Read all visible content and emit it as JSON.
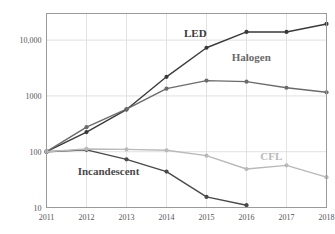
{
  "chart_data": {
    "type": "line",
    "title": "",
    "subtitle": "",
    "xlabel": "",
    "ylabel": "",
    "x": [
      2011,
      2012,
      2013,
      2014,
      2015,
      2016,
      2017,
      2018
    ],
    "categories": [
      "2011",
      "2012",
      "2013",
      "2014",
      "2015",
      "2016",
      "2017",
      "2018"
    ],
    "y_scale": "log",
    "ylim": [
      10,
      30000
    ],
    "y_ticks": [
      10,
      100,
      1000,
      10000
    ],
    "y_tick_labels": [
      "10",
      "100",
      "1000",
      "10,000"
    ],
    "x_tick_labels": [
      "2011",
      "2012",
      "2013",
      "2014",
      "2015",
      "2016",
      "2017",
      "2018"
    ],
    "grid": true,
    "grid_x": true,
    "grid_y": true,
    "legend": "inline-labels",
    "legend_position": "inline",
    "series": [
      {
        "name": "LED",
        "color": "#3a3a3a",
        "label": "LED",
        "label_x": 2014.72,
        "label_y": 11500,
        "values": [
          100,
          225,
          570,
          2200,
          7300,
          14000,
          14000,
          19500
        ]
      },
      {
        "name": "Halogen",
        "color": "#6b6b6b",
        "label": "Halogen",
        "label_x": 2016.12,
        "label_y": 4200,
        "values": [
          100,
          275,
          580,
          1350,
          1880,
          1800,
          1400,
          1160
        ]
      },
      {
        "name": "Incandescent",
        "color": "#4a4a4a",
        "label": "Incandescent",
        "label_x": 2012.55,
        "label_y": 38,
        "values": [
          100,
          108,
          73,
          44,
          15.5,
          11,
          null,
          null
        ]
      },
      {
        "name": "CFL",
        "color": "#b9b9b9",
        "label": "CFL",
        "label_x": 2016.62,
        "label_y": 72,
        "values": [
          100,
          112,
          110,
          106,
          85,
          49,
          57,
          35
        ]
      }
    ],
    "colors": {
      "led": "#3a3a3a",
      "halogen": "#6b6b6b",
      "incandescent": "#4a4a4a",
      "cfl": "#b9b9b9",
      "grid": "#d8d8d8",
      "frame": "#9a9a9a",
      "tick_text": "#555555",
      "background": "#ffffff"
    }
  }
}
